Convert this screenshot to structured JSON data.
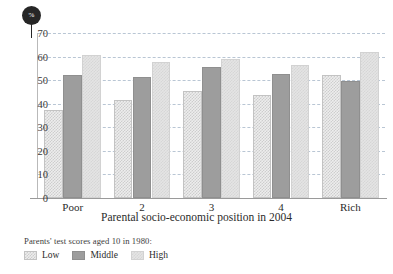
{
  "badge": {
    "label": "%",
    "icon": "percent-badge-icon",
    "color": "#262626"
  },
  "chart_data": {
    "type": "bar",
    "title": "",
    "xlabel": "Parental socio-economic position in 2004",
    "ylabel": "%",
    "categories": [
      "Poor",
      "2",
      "3",
      "4",
      "Rich"
    ],
    "series": [
      {
        "name": "Low",
        "values": [
          37.5,
          41.5,
          45.5,
          43.5,
          52.0
        ],
        "color": "#ededed"
      },
      {
        "name": "Middle",
        "values": [
          52.0,
          51.5,
          55.5,
          52.5,
          49.5
        ],
        "color": "#9d9d9d"
      },
      {
        "name": "High",
        "values": [
          60.5,
          57.5,
          59.0,
          56.5,
          62.0
        ],
        "color": "#e4e4e4"
      }
    ],
    "ylim": [
      0,
      70
    ],
    "yticks": [
      0,
      10,
      20,
      30,
      40,
      50,
      60,
      70
    ],
    "ytick_labels": [
      "0",
      "10",
      "20",
      "30",
      "40",
      "50",
      "60",
      "70"
    ],
    "grid": true,
    "grid_style": "dashed",
    "grid_color": "#b9c6d4",
    "legend_position": "below",
    "legend_title": "Parents' test scores aged 10 in 1980:",
    "legend_entries": [
      "Low",
      "Middle",
      "High"
    ]
  }
}
